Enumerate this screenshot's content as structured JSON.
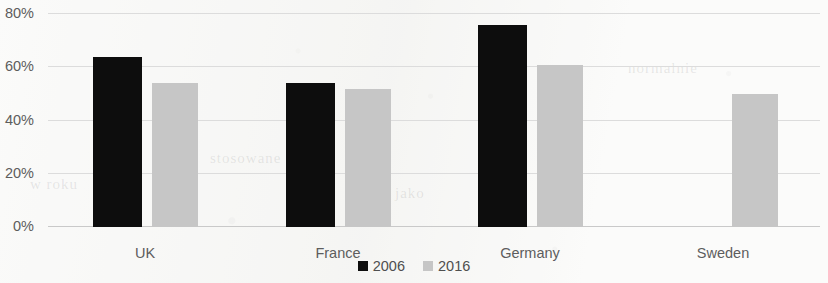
{
  "chart_data": {
    "type": "bar",
    "title": "",
    "xlabel": "",
    "ylabel": "",
    "categories": [
      "UK",
      "France",
      "Germany",
      "Sweden"
    ],
    "series": [
      {
        "name": "2006",
        "color": "#0d0d0d",
        "values": [
          64,
          54,
          76,
          null
        ]
      },
      {
        "name": "2016",
        "color": "#c6c6c6",
        "values": [
          54,
          52,
          61,
          50
        ]
      }
    ],
    "ylim": [
      0,
      80
    ],
    "y_ticks": [
      0,
      20,
      40,
      60,
      80
    ],
    "y_tick_labels": [
      "0%",
      "20%",
      "40%",
      "60%",
      "80%"
    ],
    "grid": true,
    "legend_position": "bottom"
  },
  "axis": {
    "y_tick_labels": [
      "80%",
      "60%",
      "40%",
      "20%",
      "0%"
    ],
    "x_tick_labels": [
      "UK",
      "France",
      "Germany",
      "Sweden"
    ]
  },
  "legend": {
    "items": [
      {
        "label": "2006",
        "color": "#0d0d0d"
      },
      {
        "label": "2016",
        "color": "#c6c6c6"
      }
    ]
  },
  "background_artifacts": [
    {
      "text": "normalnie",
      "x": 628,
      "y": 60
    },
    {
      "text": "stosowane",
      "x": 210,
      "y": 150
    },
    {
      "text": "jako",
      "x": 395,
      "y": 185
    },
    {
      "text": "w roku",
      "x": 30,
      "y": 176
    }
  ]
}
